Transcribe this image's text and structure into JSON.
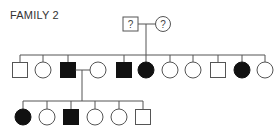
{
  "title": "FAMILY 2",
  "colors": {
    "line": "#555555",
    "affected": "#111111",
    "unaffected": "#ffffff"
  },
  "generation1": {
    "members": [
      {
        "sex": "male",
        "status": "unknown",
        "label": "?",
        "cx": 130,
        "cy": 24
      },
      {
        "sex": "female",
        "status": "unknown",
        "label": "?",
        "cx": 163,
        "cy": 24
      }
    ]
  },
  "generation2": {
    "members": [
      {
        "sex": "male",
        "affected": false,
        "cx": 20
      },
      {
        "sex": "female",
        "affected": false,
        "cx": 43
      },
      {
        "sex": "male",
        "affected": true,
        "cx": 68,
        "has_spouse": true
      },
      {
        "sex": "female",
        "affected": false,
        "cx": 98,
        "role": "spouse"
      },
      {
        "sex": "male",
        "affected": true,
        "cx": 124
      },
      {
        "sex": "female",
        "affected": true,
        "cx": 146
      },
      {
        "sex": "female",
        "affected": false,
        "cx": 170
      },
      {
        "sex": "female",
        "affected": false,
        "cx": 193
      },
      {
        "sex": "male",
        "affected": false,
        "cx": 218
      },
      {
        "sex": "female",
        "affected": true,
        "cx": 242
      },
      {
        "sex": "female",
        "affected": false,
        "cx": 265
      }
    ]
  },
  "generation3": {
    "members": [
      {
        "sex": "female",
        "affected": true,
        "cx": 23
      },
      {
        "sex": "female",
        "affected": false,
        "cx": 47
      },
      {
        "sex": "male",
        "affected": true,
        "cx": 71
      },
      {
        "sex": "female",
        "affected": false,
        "cx": 95
      },
      {
        "sex": "female",
        "affected": false,
        "cx": 119
      },
      {
        "sex": "male",
        "affected": false,
        "cx": 143
      }
    ]
  }
}
